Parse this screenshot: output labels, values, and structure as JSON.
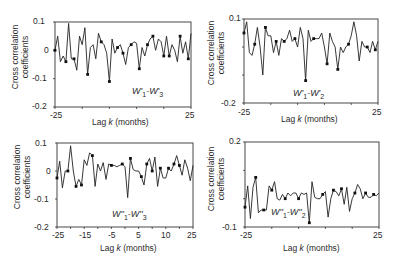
{
  "figure": {
    "ylabel_line1": "Cross correlation",
    "ylabel_line2": "coefficients",
    "xlabel_prefix": "Lag ",
    "xlabel_k": "k",
    "xlabel_suffix": " (months)"
  },
  "chart_data": [
    {
      "type": "line",
      "title": "W'1-W'3",
      "legend": {
        "main1": "W'",
        "sub1": "1",
        "sep": "-",
        "main2": "W'",
        "sub2": "3"
      },
      "xlabel": "Lag k (months)",
      "ylabel": "Cross correlation coefficients",
      "xlim": [
        -25,
        25
      ],
      "ylim": [
        -0.2,
        0.1
      ],
      "xticks_labeled": [
        "-25",
        "25"
      ],
      "yticks_labeled": [
        "0.1",
        "0",
        "-0.1",
        "-0.2"
      ],
      "x": [
        -25,
        -24,
        -23,
        -22,
        -21,
        -20,
        -19,
        -18,
        -17,
        -16,
        -15,
        -14,
        -13,
        -12,
        -11,
        -10,
        -9,
        -8,
        -7,
        -6,
        -5,
        -4,
        -3,
        -2,
        -1,
        0,
        1,
        2,
        3,
        4,
        5,
        6,
        7,
        8,
        9,
        10,
        11,
        12,
        13,
        14,
        15,
        16,
        17,
        18,
        19,
        20,
        21,
        22,
        23,
        24,
        25
      ],
      "values": [
        0.0,
        0.05,
        -0.04,
        -0.02,
        -0.04,
        0.095,
        -0.03,
        -0.03,
        -0.07,
        0.05,
        0.02,
        0.08,
        -0.085,
        0.01,
        0.02,
        -0.03,
        0.06,
        0.03,
        0.02,
        -0.01,
        -0.11,
        0.04,
        -0.01,
        0.01,
        0.02,
        -0.01,
        -0.05,
        0.01,
        0.02,
        0.03,
        0.025,
        -0.065,
        0.01,
        -0.02,
        0.02,
        0.04,
        0.05,
        0.0,
        0.04,
        0.03,
        -0.02,
        0.05,
        -0.02,
        0.02,
        0.0,
        -0.04,
        0.05,
        -0.01,
        0.03,
        -0.03,
        0.06
      ],
      "markers_at": [
        -25,
        -21,
        -18,
        -13,
        -8,
        -5,
        -2,
        0,
        3,
        6,
        9,
        11,
        15,
        17,
        21,
        24
      ]
    },
    {
      "type": "line",
      "title": "W'1-W'2",
      "legend": {
        "main1": "W'",
        "sub1": "1",
        "sep": "-",
        "main2": "W'",
        "sub2": "2"
      },
      "xlabel": "Lag k (months)",
      "ylabel": "Cross correlation coefficients",
      "xlim": [
        -25,
        25
      ],
      "ylim": [
        -0.2,
        0.1
      ],
      "xticks_labeled": [
        "-25",
        "25"
      ],
      "yticks_labeled": [
        "0.1",
        "-0.2"
      ],
      "x": [
        -25,
        -24,
        -23,
        -22,
        -21,
        -20,
        -19,
        -18,
        -17,
        -16,
        -15,
        -14,
        -13,
        -12,
        -11,
        -10,
        -9,
        -8,
        -7,
        -6,
        -5,
        -4,
        -3,
        -2,
        -1,
        0,
        1,
        2,
        3,
        4,
        5,
        6,
        7,
        8,
        9,
        10,
        11,
        12,
        13,
        14,
        15,
        16,
        17,
        18,
        19,
        20,
        21,
        22,
        23,
        24,
        25
      ],
      "values": [
        0.05,
        0.09,
        -0.02,
        -0.03,
        0.01,
        0.07,
        0.0,
        -0.1,
        0.07,
        0.04,
        0.04,
        -0.02,
        0.02,
        -0.03,
        0.03,
        0.02,
        0.03,
        0.06,
        0.02,
        0.03,
        0.0,
        0.07,
        0.03,
        -0.12,
        0.06,
        0.02,
        0.03,
        0.03,
        0.03,
        0.05,
        0.0,
        -0.06,
        0.05,
        0.02,
        0.0,
        -0.08,
        0.0,
        -0.02,
        0.0,
        0.01,
        0.04,
        0.09,
        0.04,
        -0.05,
        0.02,
        0.0,
        0.0,
        -0.02,
        0.02,
        -0.01,
        0.02
      ],
      "markers_at": [
        -25,
        -21,
        -17,
        -13,
        -10,
        -6,
        -2,
        1,
        6,
        10,
        14,
        21,
        24
      ]
    },
    {
      "type": "line",
      "title": "W''1-W''3",
      "legend": {
        "main1": "W''",
        "sub1": "1",
        "sep": "-",
        "main2": "W''",
        "sub2": "3"
      },
      "xlabel": "Lag k (months)",
      "ylabel": "Cross correlation coefficients",
      "xlim": [
        -25,
        25
      ],
      "ylim": [
        -0.2,
        0.1
      ],
      "xticks_labeled": [
        "-25",
        "-15",
        "-5",
        "5",
        "10",
        "15",
        "25"
      ],
      "xticks_all": [
        "-25",
        "-15",
        "-5",
        "5",
        "10",
        "25"
      ],
      "yticks_labeled": [
        "0.1",
        "0",
        "-0.1",
        "-0.2"
      ],
      "x": [
        -25,
        -24,
        -23,
        -22,
        -21,
        -20,
        -19,
        -18,
        -17,
        -16,
        -15,
        -14,
        -13,
        -12,
        -11,
        -10,
        -9,
        -8,
        -7,
        -6,
        -5,
        -4,
        -3,
        -2,
        -1,
        0,
        1,
        2,
        3,
        4,
        5,
        6,
        7,
        8,
        9,
        10,
        11,
        12,
        13,
        14,
        15,
        16,
        17,
        18,
        19,
        20,
        21,
        22,
        23,
        24,
        25
      ],
      "values": [
        -0.025,
        0.035,
        -0.06,
        0.0,
        0.0,
        0.09,
        0.0,
        -0.055,
        -0.03,
        -0.05,
        0.04,
        0.02,
        0.065,
        0.055,
        -0.055,
        0.025,
        0.0,
        0.03,
        -0.03,
        0.025,
        0.02,
        0.02,
        0.015,
        0.02,
        0.025,
        0.015,
        -0.095,
        0.045,
        0.005,
        0.0,
        0.0,
        -0.02,
        -0.05,
        0.025,
        0.045,
        0.0,
        0.05,
        -0.055,
        0.01,
        -0.025,
        -0.025,
        0.01,
        0.0,
        0.025,
        0.055,
        0.02,
        -0.015,
        0.04,
        0.01,
        -0.035,
        0.02
      ],
      "markers_at": [
        -25,
        -21,
        -18,
        -16,
        -12,
        -5,
        -1,
        2,
        6,
        8,
        10,
        13,
        16,
        18,
        20
      ]
    },
    {
      "type": "line",
      "title": "W''1-W''2",
      "legend": {
        "main1": "W''",
        "sub1": "1",
        "sep": "-",
        "main2": "W''",
        "sub2": "2"
      },
      "xlabel": "Lag k (months)",
      "ylabel": "Cross correlation coefficients",
      "xlim": [
        -25,
        25
      ],
      "ylim": [
        -0.1,
        0.2
      ],
      "xticks_labeled": [
        "-25",
        "25"
      ],
      "yticks_labeled": [
        "0.2",
        "-0.1"
      ],
      "x": [
        -25,
        -24,
        -23,
        -22,
        -21,
        -20,
        -19,
        -18,
        -17,
        -16,
        -15,
        -14,
        -13,
        -12,
        -11,
        -10,
        -9,
        -8,
        -7,
        -6,
        -5,
        -4,
        -3,
        -2,
        -1,
        0,
        1,
        2,
        3,
        4,
        5,
        6,
        7,
        8,
        9,
        10,
        11,
        12,
        13,
        14,
        15,
        16,
        17,
        18,
        19,
        20,
        21,
        22,
        23,
        24,
        25
      ],
      "values": [
        -0.03,
        0.045,
        -0.07,
        0.04,
        0.075,
        -0.05,
        -0.04,
        -0.04,
        -0.04,
        0.045,
        0.03,
        0.06,
        0.0,
        -0.005,
        0.015,
        0.0,
        0.02,
        0.01,
        0.02,
        0.02,
        0.0,
        0.02,
        0.015,
        0.02,
        -0.085,
        0.06,
        0.005,
        -0.0,
        0.0,
        0.015,
        0.025,
        -0.065,
        0.0,
        0.03,
        0.025,
        0.01,
        0.035,
        -0.02,
        0.04,
        -0.045,
        0.0,
        0.02,
        0.05,
        0.035,
        0.0,
        0.02,
        0.005,
        0.005,
        0.015,
        0.01,
        0.02
      ],
      "markers_at": [
        -25,
        -21,
        -18,
        -15,
        -10,
        -5,
        -1,
        4,
        8,
        11,
        16,
        20,
        23
      ]
    }
  ],
  "panels": [
    {
      "legend_prefix": "W'",
      "legend_num1": "1",
      "legend_num2": "3"
    },
    {
      "legend_prefix": "W'",
      "legend_num1": "1",
      "legend_num2": "2"
    },
    {
      "legend_prefix": "W''",
      "legend_num1": "1",
      "legend_num2": "3"
    },
    {
      "legend_prefix": "W''",
      "legend_num1": "1",
      "legend_num2": "2"
    }
  ]
}
